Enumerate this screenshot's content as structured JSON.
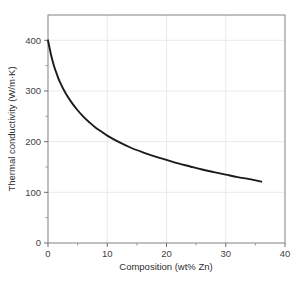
{
  "chart_data": {
    "type": "line",
    "title": "",
    "xlabel": "Composition (wt% Zn)",
    "ylabel": "Thermal conductivity (W/m·K)",
    "xlim": [
      0,
      40
    ],
    "ylim": [
      0,
      450
    ],
    "xticks": [
      0,
      10,
      20,
      30,
      40
    ],
    "xtick_labels": [
      "0",
      "10",
      "20",
      "30",
      "40"
    ],
    "yticks": [
      0,
      100,
      200,
      300,
      400
    ],
    "ytick_labels": [
      "0",
      "100",
      "200",
      "300",
      "400"
    ],
    "grid": true,
    "grid_color": "#e6e6e6",
    "legend": null,
    "series": [
      {
        "name": "Thermal conductivity of Cu-Zn alloy",
        "color": "#1a1a1a",
        "line_width": 1.9,
        "x": [
          0,
          0.5,
          1,
          1.5,
          2,
          3,
          4,
          5,
          6,
          7,
          8,
          9,
          10,
          12,
          14,
          16,
          18,
          20,
          22,
          24,
          26,
          28,
          30,
          32,
          34,
          36
        ],
        "y": [
          400,
          372,
          350,
          333,
          318,
          295,
          277,
          262,
          249,
          238,
          228,
          220,
          212,
          199,
          188,
          179,
          171,
          164,
          157,
          151,
          145,
          140,
          135,
          130,
          126,
          121
        ]
      }
    ],
    "annotations": []
  },
  "figure": {
    "background_color": "#ffffff",
    "axes_color": "#808080",
    "text_color": "#3a3a3a"
  }
}
